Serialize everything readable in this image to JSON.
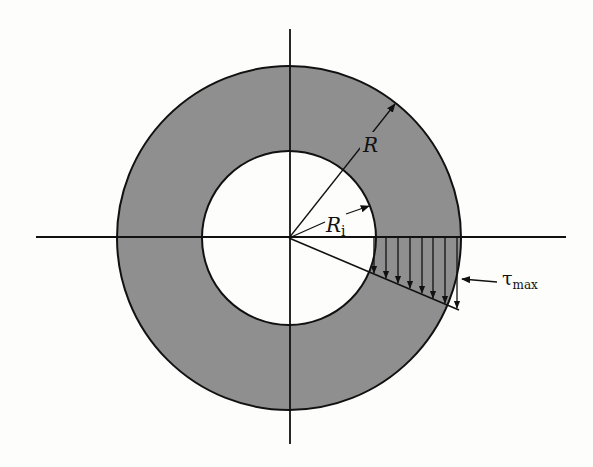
{
  "diagram": {
    "type": "annular cross-section with linear shear stress distribution",
    "colors": {
      "annulus_fill": "#8f8f8f",
      "hole_fill": "#fdfdfc",
      "line": "#111111"
    },
    "geometry": {
      "center": [
        289,
        238
      ],
      "outer_radius": 172,
      "inner_radius": 87,
      "h_axis": [
        36,
        566
      ],
      "v_axis": [
        29,
        444
      ]
    },
    "labels": {
      "outer_radius": "R",
      "inner_radius_main": "R",
      "inner_radius_sub": "i",
      "tau_symbol": "τ",
      "tau_sub": "max"
    },
    "stress_arrows_x": [
      374,
      386,
      398,
      410,
      422,
      433,
      445,
      456
    ]
  }
}
